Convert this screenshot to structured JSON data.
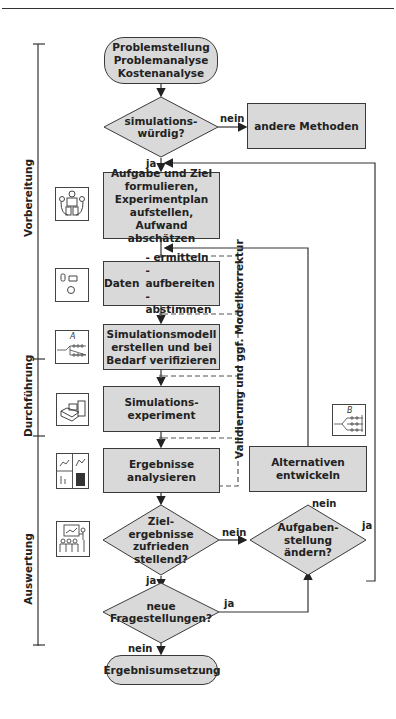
{
  "diagram": {
    "phases": [
      {
        "label": "Vorbereitung"
      },
      {
        "label": "Durchführung"
      },
      {
        "label": "Auswertung"
      }
    ],
    "nodes": {
      "start": {
        "lines": [
          "Problemstellung",
          "Problemanalyse",
          "Kostenanalyse"
        ]
      },
      "decision_simwuerdig": {
        "lines": [
          "simulations-",
          "würdig?"
        ]
      },
      "andere_methoden": {
        "text": "andere Methoden"
      },
      "aufgabe": {
        "lines": [
          "Aufgabe und Ziel",
          "formulieren,",
          "Experimentplan",
          "aufstellen, Aufwand",
          "abschätzen"
        ]
      },
      "daten": {
        "label": "Daten",
        "items": [
          "- ermitteln",
          "- aufbereiten",
          "- abstimmen"
        ]
      },
      "modell": {
        "lines": [
          "Simulationsmodell",
          "erstellen und bei",
          "Bedarf verifizieren"
        ]
      },
      "experiment": {
        "lines": [
          "Simulations-",
          "experiment"
        ]
      },
      "ergebnisse": {
        "lines": [
          "Ergebnisse",
          "analysieren"
        ]
      },
      "decision_ziel": {
        "lines": [
          "Ziel-",
          "ergebnisse",
          "zufrieden",
          "stellend?"
        ]
      },
      "decision_aufgabe": {
        "lines": [
          "Aufgaben-",
          "stellung",
          "ändern?"
        ]
      },
      "alternativen": {
        "lines": [
          "Alternativen",
          "entwickeln"
        ]
      },
      "decision_neue": {
        "lines": [
          "neue",
          "Fragestellungen?"
        ]
      },
      "end": {
        "text": "Ergebnisumsetzung"
      }
    },
    "edges": {
      "nein_1": "nein",
      "ja_1": "ja",
      "nein_2": "nein",
      "nein_3": "nein",
      "ja_2": "ja",
      "ja_3": "ja",
      "ja_4": "ja",
      "nein_4": "nein"
    },
    "feedback_label": "Validierung und ggf. Modellkorrektur",
    "icons": {
      "model_a_letter": "A",
      "model_b_letter": "B"
    },
    "colors": {
      "box_fill": "#d9d9d9",
      "stroke": "#3a3a3a",
      "text": "#222222"
    }
  }
}
